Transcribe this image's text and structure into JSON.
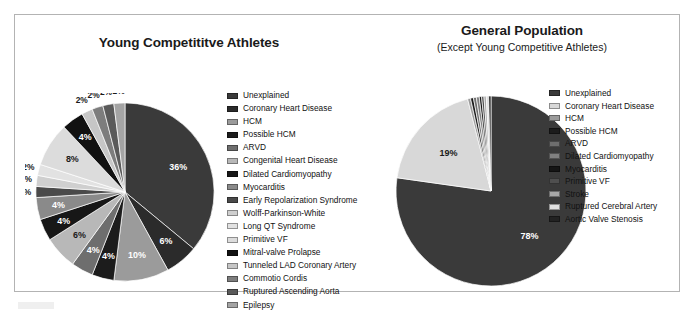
{
  "figure": {
    "panels": [
      {
        "id": "young-competitive-athletes",
        "title": "Young Competititve Athletes",
        "subtitle": ""
      },
      {
        "id": "general-population",
        "title": "General Population",
        "subtitle": "(Except Young Competitive Athletes)"
      }
    ]
  },
  "chart_data": [
    {
      "type": "pie",
      "title": "Young Competititve Athletes",
      "subtitle": "",
      "legend_position": "right",
      "units": "percent",
      "categories": [
        "Unexplained",
        "Coronary Heart Disease",
        "HCM",
        "Possible HCM",
        "ARVD",
        "Congenital Heart Disease",
        "Dilated Cardiomyopathy",
        "Myocarditis",
        "Early Repolarization Syndrome",
        "Wolff-Parkinson-White",
        "Long QT Syndrome",
        "Primitive VF",
        "Mitral-valve Prolapse",
        "Tunneled LAD Coronary Artery",
        "Commotio Cordis",
        "Ruptured Ascending Aorta",
        "Epilepsy"
      ],
      "values": [
        36,
        6,
        10,
        4,
        4,
        6,
        4,
        4,
        2,
        2,
        2,
        8,
        4,
        2,
        2,
        2,
        2
      ],
      "labels": [
        "36%",
        "6%",
        "10%",
        "4%",
        "4%",
        "6%",
        "4%",
        "4%",
        "2%",
        "2%",
        "2%",
        "8%",
        "4%",
        "2%",
        "2%",
        "2%",
        "2%"
      ],
      "colors": [
        "#3a3a3a",
        "#2b2b2b",
        "#9b9b9b",
        "#1c1c1c",
        "#6e6e6e",
        "#b8b8b8",
        "#171717",
        "#8a8a8a",
        "#4a4a4a",
        "#cfcfcf",
        "#e2e2e2",
        "#dcdcdc",
        "#111111",
        "#c6c6c6",
        "#7d7d7d",
        "#5a5a5a",
        "#a4a4a4"
      ]
    },
    {
      "type": "pie",
      "title": "General Population",
      "subtitle": "(Except Young Competitive Athletes)",
      "legend_position": "right",
      "units": "percent",
      "categories": [
        "Unexplained",
        "Coronary Heart Disease",
        "HCM",
        "Possible HCM",
        "ARVD",
        "Dilated Cardiomyopathy",
        "Myocarditis",
        "Primitive VF",
        "Stroke",
        "Ruptured Cerebral Artery",
        "Aortic Valve Stenosis"
      ],
      "values": [
        78,
        19,
        0.5,
        0.5,
        0.5,
        0.5,
        0.4,
        0.4,
        0.4,
        0.4,
        0.4
      ],
      "labels": [
        "78%",
        "19%",
        "",
        "",
        "",
        "",
        "",
        "",
        "",
        "",
        ""
      ],
      "colors": [
        "#3a3a3a",
        "#d8d8d8",
        "#9b9b9b",
        "#1c1c1c",
        "#6e6e6e",
        "#808080",
        "#151515",
        "#4f4f4f",
        "#a8a8a8",
        "#e0e0e0",
        "#222222"
      ]
    }
  ],
  "legends": {
    "left": {
      "items": [
        {
          "label": "Unexplained",
          "color": "#3a3a3a"
        },
        {
          "label": "Coronary Heart Disease",
          "color": "#2b2b2b"
        },
        {
          "label": "HCM",
          "color": "#9b9b9b"
        },
        {
          "label": "Possible HCM",
          "color": "#1c1c1c"
        },
        {
          "label": "ARVD",
          "color": "#6e6e6e"
        },
        {
          "label": "Congenital Heart Disease",
          "color": "#b8b8b8"
        },
        {
          "label": "Dilated Cardiomyopathy",
          "color": "#171717"
        },
        {
          "label": "Myocarditis",
          "color": "#8a8a8a"
        },
        {
          "label": "Early Repolarization Syndrome",
          "color": "#4a4a4a"
        },
        {
          "label": "Wolff-Parkinson-White",
          "color": "#cfcfcf"
        },
        {
          "label": "Long QT Syndrome",
          "color": "#e2e2e2"
        },
        {
          "label": "Primitive VF",
          "color": "#dcdcdc"
        },
        {
          "label": "Mitral-valve Prolapse",
          "color": "#111111"
        },
        {
          "label": "Tunneled LAD Coronary Artery",
          "color": "#c6c6c6"
        },
        {
          "label": "Commotio Cordis",
          "color": "#7d7d7d"
        },
        {
          "label": "Ruptured Ascending Aorta",
          "color": "#5a5a5a"
        },
        {
          "label": "Epilepsy",
          "color": "#a4a4a4"
        }
      ]
    },
    "right": {
      "items": [
        {
          "label": "Unexplained",
          "color": "#3a3a3a"
        },
        {
          "label": "Coronary Heart Disease",
          "color": "#d8d8d8"
        },
        {
          "label": "HCM",
          "color": "#9b9b9b"
        },
        {
          "label": "Possible HCM",
          "color": "#1c1c1c"
        },
        {
          "label": "ARVD",
          "color": "#6e6e6e"
        },
        {
          "label": "Dilated Cardiomyopathy",
          "color": "#808080"
        },
        {
          "label": "Myocarditis",
          "color": "#151515"
        },
        {
          "label": "Primitive VF",
          "color": "#4f4f4f"
        },
        {
          "label": "Stroke",
          "color": "#a8a8a8"
        },
        {
          "label": "Ruptured Cerebral Artery",
          "color": "#e0e0e0"
        },
        {
          "label": "Aortic Valve Stenosis",
          "color": "#222222"
        }
      ]
    }
  }
}
